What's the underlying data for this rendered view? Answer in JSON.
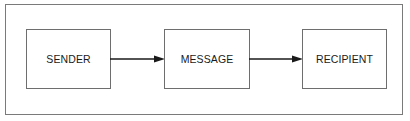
{
  "diagram": {
    "type": "flow",
    "nodes": [
      {
        "id": "sender",
        "label": "SENDER"
      },
      {
        "id": "message",
        "label": "MESSAGE"
      },
      {
        "id": "recipient",
        "label": "RECIPIENT"
      }
    ],
    "edges": [
      {
        "from": "sender",
        "to": "message"
      },
      {
        "from": "message",
        "to": "recipient"
      }
    ],
    "colors": {
      "line": "#6e6e6e",
      "arrow": "#1a1a1a",
      "text": "#1a1a1a"
    }
  }
}
